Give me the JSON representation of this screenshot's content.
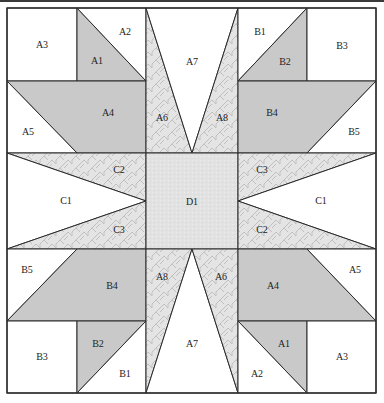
{
  "diagram": {
    "type": "quilt-block-pattern",
    "colors": {
      "white": "#ffffff",
      "gray": "#c9c9c9",
      "pattern_bg": "#e4e4e4",
      "pattern_line": "#c2c2c2",
      "center_bg": "#e2e2e2",
      "outline": "#2b2b2b"
    },
    "pieces": [
      {
        "id": "tl-A3",
        "label": "A3",
        "fill": "white",
        "points": [
          [
            7,
            8
          ],
          [
            77,
            8
          ],
          [
            77,
            81
          ],
          [
            7,
            81
          ]
        ],
        "lx": 42,
        "ly": 44
      },
      {
        "id": "tl-A1",
        "label": "A1",
        "fill": "gray",
        "points": [
          [
            77,
            8
          ],
          [
            146,
            81
          ],
          [
            77,
            81
          ]
        ],
        "lx": 97,
        "ly": 60
      },
      {
        "id": "tl-A2",
        "label": "A2",
        "fill": "white",
        "points": [
          [
            77,
            8
          ],
          [
            146,
            8
          ],
          [
            146,
            81
          ]
        ],
        "lx": 125,
        "ly": 31
      },
      {
        "id": "tl-A4",
        "label": "A4",
        "fill": "gray",
        "points": [
          [
            7,
            81
          ],
          [
            146,
            81
          ],
          [
            146,
            153
          ],
          [
            77,
            153
          ]
        ],
        "lx": 108,
        "ly": 112
      },
      {
        "id": "tl-A5",
        "label": "A5",
        "fill": "white",
        "points": [
          [
            7,
            81
          ],
          [
            77,
            153
          ],
          [
            7,
            153
          ]
        ],
        "lx": 28,
        "ly": 131
      },
      {
        "id": "top-A6",
        "label": "A6",
        "fill": "pattern",
        "points": [
          [
            146,
            8
          ],
          [
            192,
            153
          ],
          [
            146,
            153
          ]
        ],
        "lx": 162,
        "ly": 117
      },
      {
        "id": "top-A7",
        "label": "A7",
        "fill": "white",
        "points": [
          [
            146,
            8
          ],
          [
            238,
            8
          ],
          [
            192,
            153
          ]
        ],
        "lx": 192,
        "ly": 61
      },
      {
        "id": "top-A8",
        "label": "A8",
        "fill": "pattern",
        "points": [
          [
            238,
            8
          ],
          [
            238,
            153
          ],
          [
            192,
            153
          ]
        ],
        "lx": 222,
        "ly": 117
      },
      {
        "id": "tr-B1",
        "label": "B1",
        "fill": "white",
        "points": [
          [
            238,
            8
          ],
          [
            307,
            8
          ],
          [
            238,
            81
          ]
        ],
        "lx": 260,
        "ly": 31
      },
      {
        "id": "tr-B2",
        "label": "B2",
        "fill": "gray",
        "points": [
          [
            307,
            8
          ],
          [
            307,
            81
          ],
          [
            238,
            81
          ]
        ],
        "lx": 285,
        "ly": 61
      },
      {
        "id": "tr-B3",
        "label": "B3",
        "fill": "white",
        "points": [
          [
            307,
            8
          ],
          [
            376,
            8
          ],
          [
            376,
            81
          ],
          [
            307,
            81
          ]
        ],
        "lx": 342,
        "ly": 45
      },
      {
        "id": "tr-B4",
        "label": "B4",
        "fill": "gray",
        "points": [
          [
            238,
            81
          ],
          [
            307,
            81
          ],
          [
            376,
            81
          ],
          [
            307,
            153
          ],
          [
            238,
            153
          ]
        ],
        "lx": 272,
        "ly": 112
      },
      {
        "id": "tr-B5",
        "label": "B5",
        "fill": "white",
        "points": [
          [
            376,
            81
          ],
          [
            376,
            153
          ],
          [
            307,
            153
          ]
        ],
        "lx": 354,
        "ly": 131
      },
      {
        "id": "ml-C2",
        "label": "C2",
        "fill": "pattern",
        "points": [
          [
            7,
            153
          ],
          [
            146,
            153
          ],
          [
            146,
            201
          ]
        ],
        "lx": 119,
        "ly": 169
      },
      {
        "id": "ml-C1",
        "label": "C1",
        "fill": "white",
        "points": [
          [
            7,
            153
          ],
          [
            146,
            201
          ],
          [
            7,
            249
          ]
        ],
        "lx": 66,
        "ly": 200
      },
      {
        "id": "ml-C3",
        "label": "C3",
        "fill": "pattern",
        "points": [
          [
            146,
            201
          ],
          [
            146,
            249
          ],
          [
            7,
            249
          ]
        ],
        "lx": 119,
        "ly": 229
      },
      {
        "id": "center-D1",
        "label": "D1",
        "fill": "center",
        "points": [
          [
            146,
            153
          ],
          [
            238,
            153
          ],
          [
            238,
            249
          ],
          [
            146,
            249
          ]
        ],
        "lx": 192,
        "ly": 201
      },
      {
        "id": "mr-C3",
        "label": "C3",
        "fill": "pattern",
        "points": [
          [
            238,
            153
          ],
          [
            376,
            153
          ],
          [
            238,
            201
          ]
        ],
        "lx": 262,
        "ly": 169
      },
      {
        "id": "mr-C1",
        "label": "C1",
        "fill": "white",
        "points": [
          [
            376,
            153
          ],
          [
            376,
            249
          ],
          [
            238,
            201
          ]
        ],
        "lx": 321,
        "ly": 200
      },
      {
        "id": "mr-C2",
        "label": "C2",
        "fill": "pattern",
        "points": [
          [
            238,
            201
          ],
          [
            376,
            249
          ],
          [
            238,
            249
          ]
        ],
        "lx": 262,
        "ly": 229
      },
      {
        "id": "bl-B5",
        "label": "B5",
        "fill": "white",
        "points": [
          [
            7,
            249
          ],
          [
            77,
            249
          ],
          [
            7,
            321
          ]
        ],
        "lx": 27,
        "ly": 269
      },
      {
        "id": "bl-B4",
        "label": "B4",
        "fill": "gray",
        "points": [
          [
            77,
            249
          ],
          [
            146,
            249
          ],
          [
            146,
            321
          ],
          [
            77,
            321
          ],
          [
            7,
            321
          ]
        ],
        "lx": 112,
        "ly": 285
      },
      {
        "id": "bl-B3",
        "label": "B3",
        "fill": "white",
        "points": [
          [
            7,
            321
          ],
          [
            77,
            321
          ],
          [
            77,
            393
          ],
          [
            7,
            393
          ]
        ],
        "lx": 42,
        "ly": 356
      },
      {
        "id": "bl-B2",
        "label": "B2",
        "fill": "gray",
        "points": [
          [
            77,
            321
          ],
          [
            146,
            321
          ],
          [
            77,
            393
          ]
        ],
        "lx": 98,
        "ly": 343
      },
      {
        "id": "bl-B1",
        "label": "B1",
        "fill": "white",
        "points": [
          [
            146,
            321
          ],
          [
            146,
            393
          ],
          [
            77,
            393
          ]
        ],
        "lx": 125,
        "ly": 373
      },
      {
        "id": "bot-A8",
        "label": "A8",
        "fill": "pattern",
        "points": [
          [
            146,
            249
          ],
          [
            192,
            249
          ],
          [
            146,
            393
          ]
        ],
        "lx": 162,
        "ly": 276
      },
      {
        "id": "bot-A7",
        "label": "A7",
        "fill": "white",
        "points": [
          [
            192,
            249
          ],
          [
            238,
            393
          ],
          [
            146,
            393
          ]
        ],
        "lx": 192,
        "ly": 343
      },
      {
        "id": "bot-A6",
        "label": "A6",
        "fill": "pattern",
        "points": [
          [
            192,
            249
          ],
          [
            238,
            249
          ],
          [
            238,
            393
          ]
        ],
        "lx": 221,
        "ly": 276
      },
      {
        "id": "br-A4",
        "label": "A4",
        "fill": "gray",
        "points": [
          [
            238,
            249
          ],
          [
            307,
            249
          ],
          [
            376,
            321
          ],
          [
            238,
            321
          ]
        ],
        "lx": 273,
        "ly": 285
      },
      {
        "id": "br-A5",
        "label": "A5",
        "fill": "white",
        "points": [
          [
            307,
            249
          ],
          [
            376,
            249
          ],
          [
            376,
            321
          ]
        ],
        "lx": 355,
        "ly": 269
      },
      {
        "id": "br-A1",
        "label": "A1",
        "fill": "gray",
        "points": [
          [
            238,
            321
          ],
          [
            307,
            321
          ],
          [
            307,
            393
          ]
        ],
        "lx": 284,
        "ly": 343
      },
      {
        "id": "br-A2",
        "label": "A2",
        "fill": "white",
        "points": [
          [
            238,
            321
          ],
          [
            307,
            393
          ],
          [
            238,
            393
          ]
        ],
        "lx": 257,
        "ly": 373
      },
      {
        "id": "br-A3",
        "label": "A3",
        "fill": "white",
        "points": [
          [
            307,
            321
          ],
          [
            376,
            321
          ],
          [
            376,
            393
          ],
          [
            307,
            393
          ]
        ],
        "lx": 342,
        "ly": 356
      }
    ]
  }
}
